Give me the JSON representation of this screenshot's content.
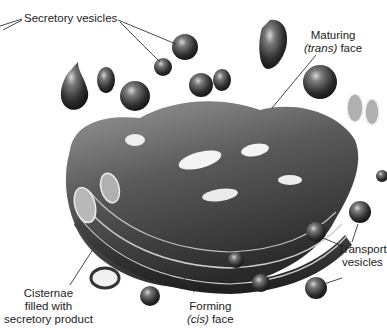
{
  "diagram": {
    "labels": {
      "secretory_vesicles": "Secretory vesicles",
      "maturing_line1": "Maturing",
      "maturing_italic": "(trans)",
      "maturing_rest": " face",
      "cisternae_line1": "Cisternae",
      "cisternae_line2": "filled with",
      "cisternae_line3": "secretory product",
      "forming_line1": "Forming",
      "forming_italic": "(cis)",
      "forming_rest": " face",
      "transport_line1": "Transport",
      "transport_line2": "vesicles"
    },
    "colors": {
      "background": "#ffffff",
      "organelle_dark": "#2a2a2a",
      "organelle_mid": "#6e6e6e",
      "organelle_light": "#bdbdbd",
      "leader_line": "#333333",
      "text": "#222222"
    }
  }
}
